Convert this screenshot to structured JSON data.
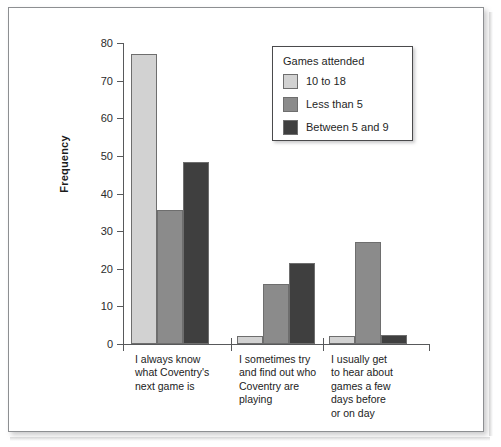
{
  "chart_data": {
    "type": "bar",
    "title": "",
    "xlabel": "",
    "ylabel": "Frequency",
    "ylim": [
      0,
      80
    ],
    "yticks": [
      0,
      10,
      20,
      30,
      40,
      50,
      60,
      70,
      80
    ],
    "grid": false,
    "legend_position": "top-right",
    "legend_title": "Games attended",
    "categories": [
      "I always know what Coventry's next game is",
      "I sometimes try and find out who Coventry are playing",
      "I usually get to hear about games a few days before or on day"
    ],
    "category_lines": [
      [
        "I always know",
        "what Coventry's",
        "next game is"
      ],
      [
        "I sometimes try",
        "and find out who",
        "Coventry are",
        "playing"
      ],
      [
        "I usually get",
        "to hear about",
        "games a few",
        "days before",
        "or on day"
      ]
    ],
    "series": [
      {
        "name": "10 to 18",
        "color": "#d2d2d2",
        "values": [
          77,
          2,
          2
        ]
      },
      {
        "name": "Less than 5",
        "color": "#8b8b8b",
        "values": [
          35.5,
          16,
          27
        ]
      },
      {
        "name": "Between 5 and 9",
        "color": "#3f3f3f",
        "values": [
          48.5,
          21.5,
          2.5
        ]
      }
    ]
  },
  "axis": {
    "y_title": "Frequency",
    "tick_labels": [
      "80",
      "70",
      "60",
      "50",
      "40",
      "30",
      "20",
      "10",
      "0"
    ]
  },
  "legend": {
    "title": "Games attended",
    "items": [
      {
        "label": "10 to 18"
      },
      {
        "label": "Less than 5"
      },
      {
        "label": "Between 5 and 9"
      }
    ]
  },
  "colors": {
    "series_light": "#d2d2d2",
    "series_mid": "#8b8b8b",
    "series_dark": "#3f3f3f",
    "axis": "#58595b",
    "text": "#1f1f1f",
    "page_border": "#8d8f92"
  }
}
